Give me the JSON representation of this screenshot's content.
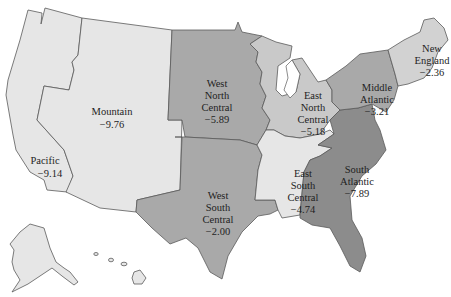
{
  "map": {
    "type": "choropleth",
    "subject": "US Census divisions",
    "colors": {
      "lightest": "#e6e6e6",
      "light": "#d2d2d2",
      "medium": "#a9a9a9",
      "dark": "#8c8c8c",
      "border": "#5a5a5a"
    },
    "regions": [
      {
        "name": "Pacific",
        "line1": "Pacific",
        "line2": "",
        "line3": "",
        "value": "−9.14"
      },
      {
        "name": "Mountain",
        "line1": "Mountain",
        "line2": "",
        "line3": "",
        "value": "−9.76"
      },
      {
        "name": "West North Central",
        "line1": "West",
        "line2": "North",
        "line3": "Central",
        "value": "−5.89"
      },
      {
        "name": "West South Central",
        "line1": "West",
        "line2": "South",
        "line3": "Central",
        "value": "−2.00"
      },
      {
        "name": "East North Central",
        "line1": "East",
        "line2": "North",
        "line3": "Central",
        "value": "−5.18"
      },
      {
        "name": "East South Central",
        "line1": "East",
        "line2": "South",
        "line3": "Central",
        "value": "−4.74"
      },
      {
        "name": "Middle Atlantic",
        "line1": "Middle",
        "line2": "Atlantic",
        "line3": "",
        "value": "−3.21"
      },
      {
        "name": "New England",
        "line1": "New",
        "line2": "England",
        "line3": "",
        "value": "−2.36"
      },
      {
        "name": "South Atlantic",
        "line1": "South",
        "line2": "Atlantic",
        "line3": "",
        "value": "−7.89"
      }
    ]
  }
}
